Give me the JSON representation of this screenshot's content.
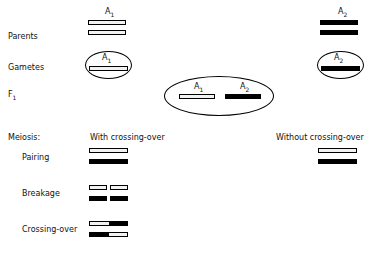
{
  "figure": {
    "background_color": "#ffffff",
    "line_color": "#000000",
    "light_chromosome_fill": "#f2f2f2",
    "dark_chromosome_fill": "#000000"
  },
  "row_labels": {
    "parents": "Parents",
    "gametes": "Gametes",
    "f1": "F",
    "f1_subscript": "1",
    "meiosis": "Meiosis:",
    "pairing": "Pairing",
    "breakage": "Breakage",
    "crossing_over": "Crossing-over"
  },
  "column_headers": {
    "with_crossing_over": "With crossing-over",
    "without_crossing_over": "Without crossing-over"
  },
  "alleles": {
    "a1": "A",
    "a1_subscript": "1",
    "a2": "A",
    "a2_subscript": "2"
  },
  "allele_labels": {
    "parent_left": "A",
    "parent_left_sub": "1",
    "parent_right": "A",
    "parent_right_sub": "2",
    "gamete_left": "A",
    "gamete_left_sub": "1",
    "gamete_right": "A",
    "gamete_right_sub": "2",
    "f1_left": "A",
    "f1_left_sub": "1",
    "f1_right": "A",
    "f1_right_sub": "2"
  },
  "cross": {
    "parent_left_genotype": "A1A1",
    "parent_right_genotype": "A2A2",
    "gamete_left_genotype": "A1",
    "gamete_right_genotype": "A2",
    "f1_genotype": "A1A2"
  },
  "meiosis_stages": [
    {
      "name": "Pairing",
      "with_crossing_over": [
        "light",
        "dark"
      ],
      "without_crossing_over": [
        "light",
        "dark"
      ]
    },
    {
      "name": "Breakage",
      "with_crossing_over": [
        "light-broken",
        "dark-broken"
      ],
      "without_crossing_over": []
    },
    {
      "name": "Crossing-over",
      "with_crossing_over": [
        "light-dark-recombinant",
        "dark-light-recombinant"
      ],
      "without_crossing_over": []
    }
  ]
}
